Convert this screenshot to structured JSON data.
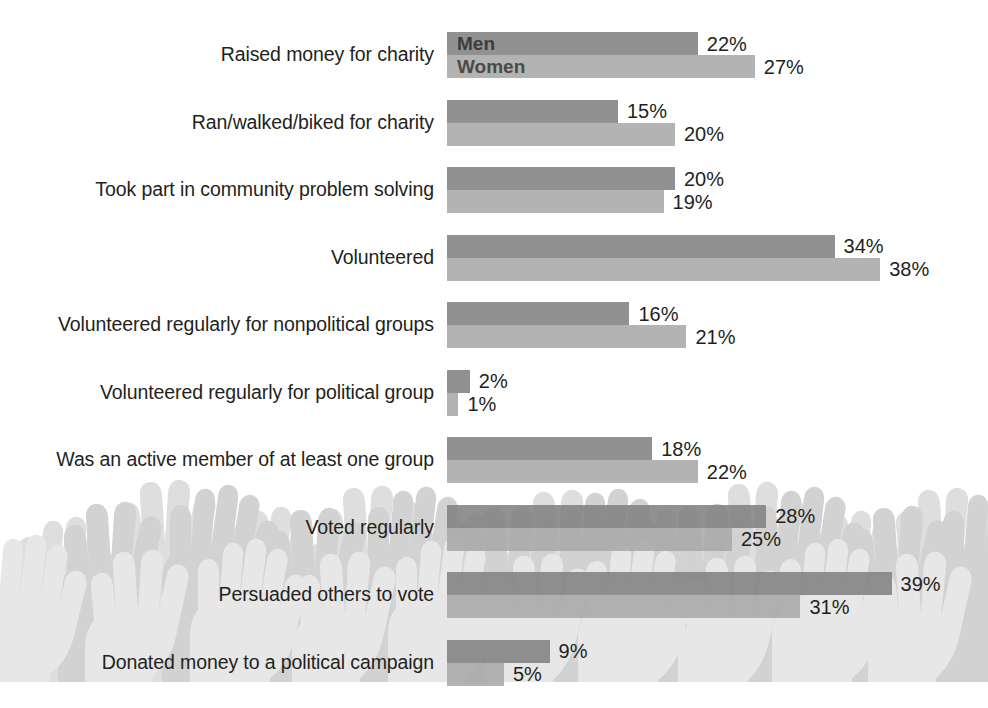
{
  "chart_data": {
    "type": "bar",
    "orientation": "horizontal",
    "title": "",
    "subtitle": "",
    "xlabel": "",
    "ylabel": "",
    "grid": false,
    "legend_position": "inside-first-bars",
    "value_suffix": "%",
    "xlim": [
      0,
      40
    ],
    "categories": [
      "Raised money for charity",
      "Ran/walked/biked for charity",
      "Took part in community problem solving",
      "Volunteered",
      "Volunteered regularly for nonpolitical groups",
      "Volunteered regularly for political group",
      "Was an active member of at least one group",
      "Voted regularly",
      "Persuaded others to vote",
      "Donated money to a political campaign"
    ],
    "series": [
      {
        "name": "Men",
        "color": "#828282",
        "values": [
          22,
          15,
          20,
          34,
          16,
          2,
          18,
          28,
          39,
          9
        ],
        "labels": [
          "22%",
          "15%",
          "20%",
          "34%",
          "16%",
          "2%",
          "18%",
          "28%",
          "39%",
          "9%"
        ]
      },
      {
        "name": "Women",
        "color": "#a8a8a8",
        "values": [
          27,
          20,
          19,
          38,
          21,
          1,
          22,
          25,
          31,
          5
        ],
        "labels": [
          "27%",
          "20%",
          "19%",
          "38%",
          "21%",
          "1%",
          "22%",
          "25%",
          "31%",
          "5%"
        ]
      }
    ]
  },
  "decoration": {
    "background_image_name": "raised-hands-silhouettes",
    "background_color": "#ffffff"
  }
}
